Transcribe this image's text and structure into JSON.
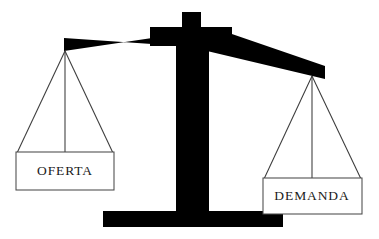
{
  "figure": {
    "background_color": "#ffffff",
    "structure_color": "#000000",
    "outline_color": "#4a4a4a",
    "text_color": "#1a1a1a"
  },
  "pans": {
    "left": {
      "label": "OFERTA",
      "state": "raised"
    },
    "right": {
      "label": "DEMANDA",
      "state": "lowered"
    }
  },
  "parts": {
    "beam": "beam",
    "post": "central-post",
    "base": "base-plate"
  }
}
